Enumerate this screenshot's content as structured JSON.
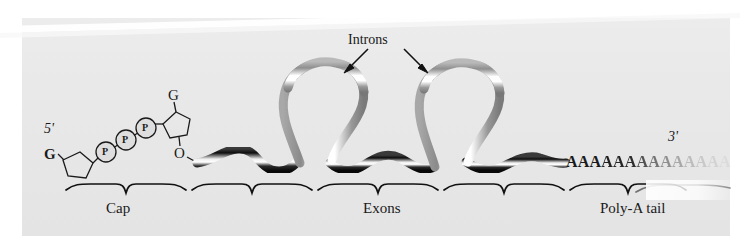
{
  "figure": {
    "background_color": "#ffffff",
    "panel_color": "#e8e8e8"
  },
  "labels": {
    "five_prime": "5'",
    "three_prime": "3'",
    "introns": "Introns",
    "guanine_left": "G",
    "guanine_right": "G",
    "oxygen": "O",
    "phosphate": "P"
  },
  "sections": [
    {
      "name": "cap",
      "label": "Cap"
    },
    {
      "name": "exons",
      "label": "Exons"
    },
    {
      "name": "poly_a_tail",
      "label": "Poly-A tail"
    }
  ],
  "phosphates": [
    {
      "label": "P"
    },
    {
      "label": "P"
    },
    {
      "label": "P"
    }
  ],
  "poly_a_tail": {
    "residues": [
      {
        "letter": "A",
        "opacity": 1.0
      },
      {
        "letter": "A",
        "opacity": 1.0
      },
      {
        "letter": "A",
        "opacity": 1.0
      },
      {
        "letter": "A",
        "opacity": 0.97
      },
      {
        "letter": "A",
        "opacity": 0.94
      },
      {
        "letter": "A",
        "opacity": 0.9
      },
      {
        "letter": "A",
        "opacity": 0.72
      },
      {
        "letter": "A",
        "opacity": 0.56
      },
      {
        "letter": "A",
        "opacity": 0.42
      },
      {
        "letter": "A",
        "opacity": 0.3
      },
      {
        "letter": "A",
        "opacity": 0.2
      },
      {
        "letter": "A",
        "opacity": 0.14
      },
      {
        "letter": "A",
        "opacity": 0.09
      },
      {
        "letter": "A",
        "opacity": 0.05
      }
    ]
  },
  "introns": {
    "count": 2,
    "arrow_count": 2
  },
  "colors": {
    "panel": "#e8e8e8",
    "exon_dark": "#1c1c1c",
    "exon_highlight": "#ffffff",
    "intron_light": "#f2f2f2",
    "intron_edge": "#8d8d8d",
    "text": "#1a1a1a",
    "brace": "#111111"
  }
}
